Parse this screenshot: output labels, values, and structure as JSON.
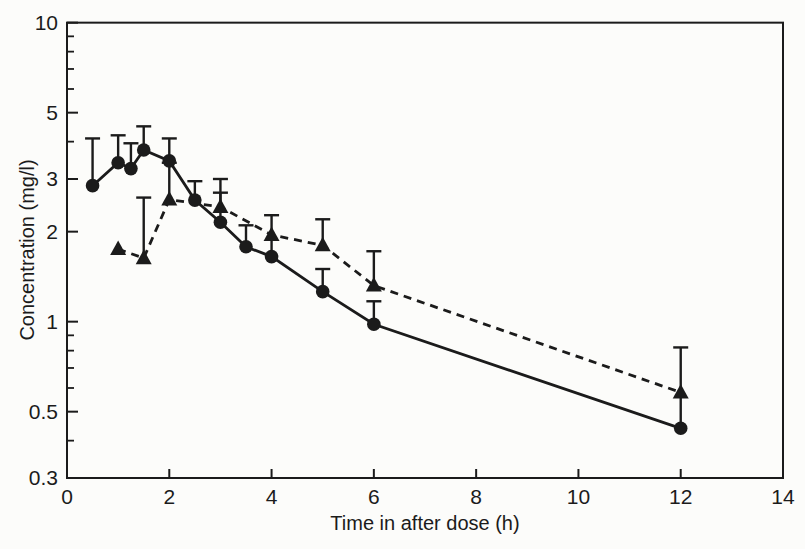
{
  "figure": {
    "background": "#fcfcfa",
    "ink_color": "#1b1b1b"
  },
  "chart_data": {
    "type": "line",
    "title": "",
    "xlabel": "Time in after dose (h)",
    "ylabel": "Concentration (mg/l)",
    "legend": null,
    "grid": false,
    "x_axis": {
      "scale": "linear",
      "min": 0,
      "max": 14,
      "tick_marks": [
        2,
        4,
        6,
        8,
        10,
        12
      ],
      "labels": [
        {
          "text": "0",
          "value": 0
        },
        {
          "text": "2",
          "value": 2
        },
        {
          "text": "4",
          "value": 4
        },
        {
          "text": "6",
          "value": 6
        },
        {
          "text": "8",
          "value": 8
        },
        {
          "text": "10",
          "value": 10
        },
        {
          "text": "12",
          "value": 12
        },
        {
          "text": "14",
          "value": 14
        }
      ]
    },
    "y_axis": {
      "scale": "log",
      "min": 0.3,
      "max": 10,
      "major_ticks": [
        {
          "text": "10",
          "value": 10
        },
        {
          "text": "5",
          "value": 5
        },
        {
          "text": "3",
          "value": 3
        },
        {
          "text": "2",
          "value": 2
        },
        {
          "text": "1",
          "value": 1
        },
        {
          "text": "0.5",
          "value": 0.5
        },
        {
          "text": "0.3",
          "value": 0.3
        }
      ],
      "minor_ticks": [
        0.4,
        0.6,
        0.7,
        0.8,
        0.9,
        4,
        6,
        7,
        8,
        9
      ]
    },
    "series": [
      {
        "name": "filled-circles-solid-line",
        "marker": "circle",
        "line": "solid",
        "color": "#1b1b1b",
        "points": [
          {
            "t": 0.5,
            "c": 2.85,
            "err_top": 4.1
          },
          {
            "t": 1,
            "c": 3.4,
            "err_top": 4.2
          },
          {
            "t": 1.25,
            "c": 3.25,
            "err_top": 3.95
          },
          {
            "t": 1.5,
            "c": 3.75,
            "err_top": 4.5
          },
          {
            "t": 2,
            "c": 3.45,
            "err_top": 4.1
          },
          {
            "t": 2.5,
            "c": 2.55,
            "err_top": 2.95
          },
          {
            "t": 3,
            "c": 2.15,
            "err_top": 2.7
          },
          {
            "t": 3.5,
            "c": 1.78,
            "err_top": 2.1
          },
          {
            "t": 4,
            "c": 1.65,
            "err_top": 2.27
          },
          {
            "t": 5,
            "c": 1.26,
            "err_top": 1.5
          },
          {
            "t": 6,
            "c": 0.98,
            "err_top": 1.17
          },
          {
            "t": 12,
            "c": 0.44,
            "err_top": 0.82
          }
        ]
      },
      {
        "name": "filled-triangles-dashed-line",
        "marker": "triangle",
        "line": "dashed",
        "color": "#1b1b1b",
        "points": [
          {
            "t": 1,
            "c": 1.75,
            "err_top": null
          },
          {
            "t": 1.5,
            "c": 1.63,
            "err_top": 2.6
          },
          {
            "t": 2,
            "c": 2.56,
            "err_top": 3.4
          },
          {
            "t": 3,
            "c": 2.42,
            "err_top": 3.0
          },
          {
            "t": 4,
            "c": 1.95,
            "err_top": null
          },
          {
            "t": 5,
            "c": 1.8,
            "err_top": 2.2
          },
          {
            "t": 6,
            "c": 1.32,
            "err_top": 1.72
          },
          {
            "t": 12,
            "c": 0.58,
            "err_top": null
          }
        ]
      }
    ]
  }
}
